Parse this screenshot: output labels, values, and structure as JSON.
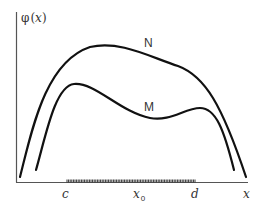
{
  "diagram": {
    "y_axis_label": {
      "prefix": "φ",
      "open": "(",
      "var": "x",
      "close": ")"
    },
    "x_axis_label": "x",
    "curves": [
      {
        "name": "N",
        "label": "N"
      },
      {
        "name": "M",
        "label": "M"
      }
    ],
    "interval": {
      "start_label": "c",
      "mid_label": "x",
      "mid_subscript": "0",
      "end_label": "d"
    },
    "colors": {
      "curve": "#111111",
      "axis": "#555555",
      "text": "#333333",
      "background": "#ffffff"
    }
  }
}
